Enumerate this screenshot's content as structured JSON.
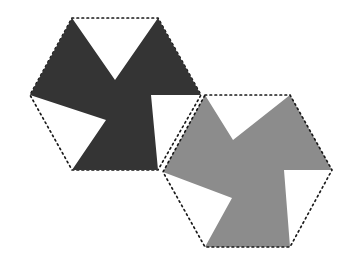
{
  "figure": {
    "canvas": {
      "width": 354,
      "height": 273,
      "background": "#ffffff"
    },
    "palette": {
      "dark_fill": "#343434",
      "gray_fill": "#8c8c8c",
      "outline_stroke": "#1a1a1a",
      "background": "#ffffff"
    },
    "outline_style": {
      "dash_pattern": "1.6 3.4",
      "stroke_width": 1.7
    },
    "shapes": [
      {
        "name": "dark-hexagon",
        "role": "upper-left hexagon outline",
        "fill": "none",
        "stroke": "#1a1a1a",
        "dotted": true,
        "points": "72,18 158,18 201,95 158,170 72,170 30,95"
      },
      {
        "name": "dark-pinwheel",
        "role": "three-bladed pinwheel filling upper-left hexagon",
        "fill": "#343434",
        "points": "72,18 115,80 158,18 201,95 151,95 158,170 72,170 106,120 30,95"
      },
      {
        "name": "gray-hexagon",
        "role": "lower-right hexagon outline",
        "fill": "none",
        "stroke": "#1a1a1a",
        "dotted": true,
        "points": "205,95 290,95 332,170 290,247 205,247 163,172"
      },
      {
        "name": "gray-pinwheel",
        "role": "three-bladed pinwheel filling lower-right hexagon",
        "fill": "#8c8c8c",
        "points": "205,95 233,140 290,95 332,170 284,170 290,247 205,247 232,198 163,172"
      }
    ]
  }
}
